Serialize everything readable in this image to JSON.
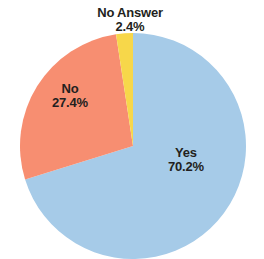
{
  "chart_data": {
    "type": "pie",
    "title": "",
    "subtitle": "",
    "xlabel": "",
    "ylabel": "",
    "legend_position": "none",
    "grid": false,
    "units": "percent",
    "start_angle_deg": 0,
    "direction": "clockwise",
    "categories": [
      "Yes",
      "No",
      "No Answer"
    ],
    "values": [
      70.2,
      27.4,
      2.4
    ],
    "colors": [
      "#a6cbe8",
      "#f78e71",
      "#f7d74a"
    ],
    "slices": [
      {
        "label": "Yes",
        "value": 70.2,
        "value_text": "70.2%",
        "color": "#a6cbe8",
        "start_angle_deg": 0,
        "end_angle_deg": 252.72,
        "label_position": "inside"
      },
      {
        "label": "No",
        "value": 27.4,
        "value_text": "27.4%",
        "color": "#f78e71",
        "start_angle_deg": 252.72,
        "end_angle_deg": 351.36,
        "label_position": "inside"
      },
      {
        "label": "No Answer",
        "value": 2.4,
        "value_text": "2.4%",
        "color": "#f7d74a",
        "start_angle_deg": 351.36,
        "end_angle_deg": 360.0,
        "label_position": "outside-top"
      }
    ]
  },
  "labels": {
    "yes": {
      "name": "Yes",
      "pct": "70.2%"
    },
    "no": {
      "name": "No",
      "pct": "27.4%"
    },
    "no_answer": {
      "name": "No Answer",
      "pct": "2.4%"
    }
  },
  "style": {
    "background": "#ffffff",
    "text_color": "#231f20",
    "color_yes": "#a6cbe8",
    "color_no": "#f78e71",
    "color_no_answer": "#f7d74a"
  },
  "geometry": {
    "center_x": 133,
    "center_y": 146,
    "radius": 113
  }
}
